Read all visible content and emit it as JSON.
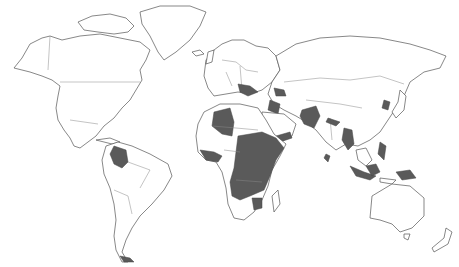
{
  "map": {
    "type": "world-choropleth",
    "projection": "equirectangular-like",
    "background": "#ffffff",
    "land_fill": "#ffffff",
    "outline_color": "#555555",
    "highlight_color": "#5a5a5a",
    "legend": null,
    "title": null,
    "highlighted_regions": [
      "Colombia",
      "Southern Chile / Tierra del Fuego",
      "Algeria",
      "West Africa coast (Guinea, Sierra Leone, Liberia, Côte d'Ivoire)",
      "Chad",
      "Sudan",
      "South Sudan",
      "Ethiopia",
      "Somalia",
      "Eritrea",
      "Yemen",
      "Central African Republic",
      "DR Congo",
      "Uganda",
      "Kenya",
      "Tanzania",
      "Angola",
      "Zimbabwe",
      "Balkans / Turkey region",
      "Caucasus",
      "Iraq",
      "Afghanistan",
      "Pakistan",
      "Nepal",
      "Myanmar",
      "Sri Lanka",
      "North Korea",
      "Philippines",
      "Indonesia",
      "Papua New Guinea"
    ]
  }
}
